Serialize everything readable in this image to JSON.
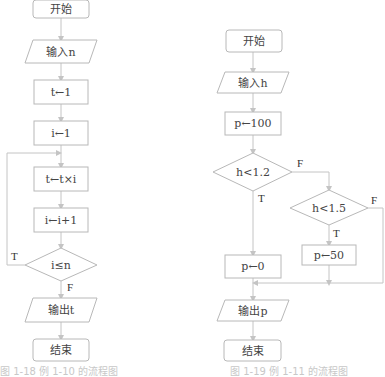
{
  "left_flowchart": {
    "start": "开始",
    "input": "输入n",
    "step1": "t←1",
    "step2": "i←1",
    "step3": "t←t×i",
    "step4": "i←i+1",
    "decision": "i≤n",
    "true_label": "T",
    "false_label": "F",
    "output": "输出t",
    "end": "结束",
    "caption": "图 1-18   例 1-10 的流程图"
  },
  "right_flowchart": {
    "start": "开始",
    "input": "输入h",
    "step1": "p←100",
    "decision1": "h<1.2",
    "decision1_false": "F",
    "decision1_true": "T",
    "decision2": "h<1.5",
    "decision2_false": "F",
    "decision2_true": "T",
    "assign_zero": "p←0",
    "assign_fifty": "p←50",
    "output": "输出p",
    "end": "结束",
    "caption": "图 1-19   例 1-11 的流程图"
  },
  "colors": {
    "stroke": "#b8b8b8",
    "line": "#c4c4c4",
    "text": "#444444"
  }
}
